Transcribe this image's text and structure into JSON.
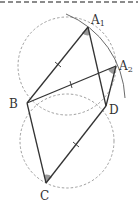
{
  "diagram": {
    "type": "geometry",
    "points": {
      "A1": {
        "label": "A",
        "sub": "1",
        "x": 88,
        "y": 27
      },
      "A2": {
        "label": "A",
        "sub": "2",
        "x": 116,
        "y": 66
      },
      "B": {
        "label": "B",
        "x": 27,
        "y": 103
      },
      "D": {
        "label": "D",
        "x": 106,
        "y": 106
      },
      "C": {
        "label": "C",
        "x": 46,
        "y": 183
      }
    },
    "segments": [
      [
        "B",
        "A1"
      ],
      [
        "A1",
        "D"
      ],
      [
        "B",
        "A2"
      ],
      [
        "A2",
        "D"
      ],
      [
        "B",
        "C"
      ],
      [
        "C",
        "D"
      ]
    ],
    "equal_marks": [
      [
        "B",
        "A1"
      ],
      [
        "B",
        "A2"
      ],
      [
        "C",
        "D"
      ]
    ],
    "angle_marks": [
      "A1",
      "A2",
      "C"
    ],
    "circles": [
      {
        "name": "upper-circle",
        "cx": 68,
        "cy": 68,
        "r": 50,
        "style": "dashed"
      },
      {
        "name": "lower-circle",
        "cx": 67,
        "cy": 140,
        "r": 48,
        "style": "dashed"
      }
    ],
    "arc": {
      "name": "arc-through-A1-A2",
      "style": "solid"
    },
    "colors": {
      "line": "#333333",
      "dashed": "#888888",
      "angle_fill": "#9a9a9a"
    }
  }
}
